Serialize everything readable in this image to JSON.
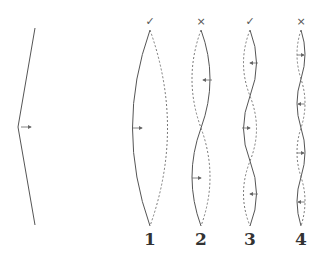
{
  "diagram": {
    "colors": {
      "line": "#555555",
      "dashed": "#777777",
      "background": "#ffffff"
    },
    "initial_shape": {
      "description": "plucked string (triangle shape) with arrow pointing right",
      "arrow": "right"
    },
    "modes": [
      {
        "label": "1",
        "mark": "✓",
        "mark_name": "check",
        "x": 150,
        "halves": 1,
        "arrows": [
          "right"
        ]
      },
      {
        "label": "2",
        "mark": "×",
        "mark_name": "cross",
        "x": 201,
        "halves": 2,
        "arrows": [
          "left",
          "right"
        ]
      },
      {
        "label": "3",
        "mark": "✓",
        "mark_name": "check",
        "x": 250,
        "halves": 3,
        "arrows": [
          "left",
          "right",
          "left"
        ]
      },
      {
        "label": "4",
        "mark": "×",
        "mark_name": "cross",
        "x": 301,
        "halves": 4,
        "arrows": [
          "right",
          "left",
          "right",
          "left"
        ]
      }
    ]
  }
}
